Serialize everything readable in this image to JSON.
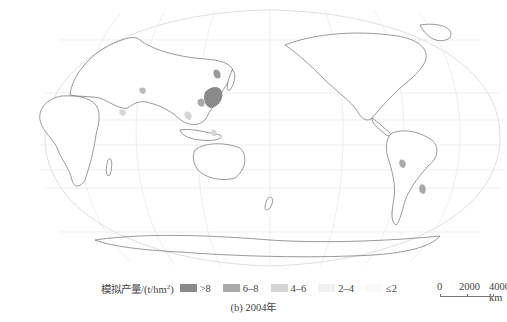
{
  "map": {
    "projection": "Robinson (Pacific-centered)",
    "features": [
      "country boundaries",
      "graticule",
      "crop-yield shading"
    ],
    "highlighted_regions": [
      "North China Plain",
      "Northeast China",
      "Southeast Asia",
      "Southern Brazil / Argentina"
    ]
  },
  "legend": {
    "title": "模拟产量/(t/hm",
    "title_sup": "2",
    "title_end": ")",
    "items": [
      {
        "label": ">8",
        "color": "#8a8a8a"
      },
      {
        "label": "6–8",
        "color": "#aaaaaa"
      },
      {
        "label": "4–6",
        "color": "#d6d6d6"
      },
      {
        "label": "2–4",
        "color": "#ececec"
      },
      {
        "label": "≤2",
        "color": "#f7f7f7"
      }
    ]
  },
  "scale": {
    "ticks": [
      "0",
      "2000",
      "4000 km"
    ]
  },
  "caption": "(b) 2004年"
}
